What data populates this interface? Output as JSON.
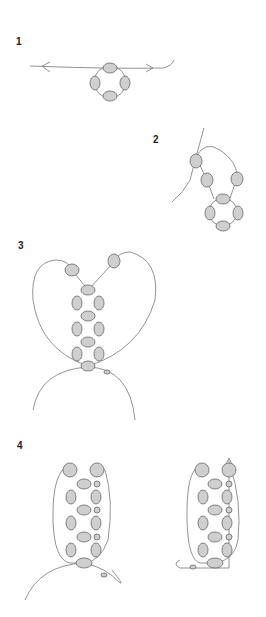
{
  "diagram": {
    "type": "beading-instructions",
    "steps": [
      {
        "label": "1",
        "description": "Four beads strung into a ring on thread"
      },
      {
        "label": "2",
        "description": "Add beads and pass thread back through"
      },
      {
        "label": "3",
        "description": "Column of bead rings with two thread loops"
      },
      {
        "label": "4",
        "description": "Completed ladder with edge beads added"
      }
    ],
    "colors": {
      "bead_fill": "#cfcfcf",
      "stroke": "#666666",
      "thread": "#777777"
    }
  }
}
